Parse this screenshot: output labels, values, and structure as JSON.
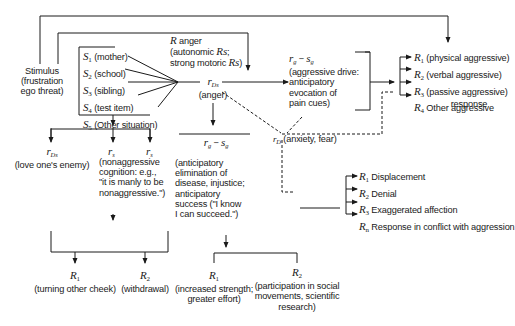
{
  "stimulus": {
    "line1": "Stimulus",
    "line2": "(frustration",
    "line3": "ego threat)"
  },
  "r_anger": {
    "symbol": "R",
    "label": "anger",
    "line2": "(autonomic ",
    "line2_sym": "Rs",
    "line2_end": ";",
    "line3": "strong motoric ",
    "line3_sym": "Rs",
    "line3_end": ")"
  },
  "stimuli_box": {
    "items": [
      {
        "sym": "S",
        "sub": "1",
        "label": "(mother)"
      },
      {
        "sym": "S",
        "sub": "2",
        "label": "(school)"
      },
      {
        "sym": "S",
        "sub": "3",
        "label": "(sibling)"
      },
      {
        "sym": "S",
        "sub": "4",
        "label": "(test item)"
      },
      {
        "sym": "S",
        "sub": "5",
        "label": "(Other situation)"
      }
    ]
  },
  "r_ds_anger": {
    "sym": "r",
    "sub": "Ds",
    "label": "(anger)"
  },
  "rg_sg_top": {
    "sym": "r",
    "sub1": "g",
    "minus": " − ",
    "sym2": "s",
    "sub2": "g",
    "line2": "(aggressive drive:",
    "line3": "anticipatory",
    "line4": "evocation of",
    "line5": "pain cues)"
  },
  "aggressive_responses": [
    {
      "sym": "R",
      "sub": "1",
      "label": "(physical aggressive)"
    },
    {
      "sym": "R",
      "sub": "2",
      "label": "(verbal aggressive)"
    },
    {
      "sym": "R",
      "sub": "3",
      "label": "(passive aggressive)"
    },
    {
      "sym": "R",
      "sub": "4",
      "label": "Other aggressive",
      "label2": "response"
    }
  ],
  "r_d_anxiety": {
    "sym": "r",
    "sub": "D",
    "label": "(anxiety, fear)"
  },
  "conflict_responses": [
    {
      "sym": "R",
      "sub": "1",
      "label": "Displacement"
    },
    {
      "sym": "R",
      "sub": "2",
      "label": "Denial"
    },
    {
      "sym": "R",
      "sub": "3",
      "label": "Exaggerated affection"
    },
    {
      "sym": "R",
      "sub": "n",
      "label": "Response in conflict with aggression"
    }
  ],
  "left_branch": {
    "r_ds": {
      "sym": "r",
      "sub": "Ds",
      "label": "(love one's enemy)"
    },
    "r_s1": {
      "sym": "r",
      "sub": "s"
    },
    "r_s2": {
      "sym": "r",
      "sub": "s"
    },
    "nonaggressive": {
      "line1": "(nonaggressive",
      "line2": "cognition: e.g.,",
      "line3": "\"it is manly to be",
      "line4": "nonaggressive.\")"
    },
    "R1": {
      "sym": "R",
      "sub": "1",
      "label": "(turning other cheek)"
    },
    "R2": {
      "sym": "R",
      "sub": "2",
      "label": "(withdrawal)"
    }
  },
  "middle_branch": {
    "rg_sg": {
      "sym": "r",
      "sub1": "g",
      "minus": " − ",
      "sym2": "s",
      "sub2": "g"
    },
    "desc": {
      "line1": "(anticipatory",
      "line2": "elimination of",
      "line3": "disease, injustice;",
      "line4": "anticipatory",
      "line5": "success (\"I know",
      "line6": "I can succeed.\")"
    },
    "R1": {
      "sym": "R",
      "sub": "1",
      "line1": "(increased strength;",
      "line2": "greater effort)"
    },
    "R2": {
      "sym": "R",
      "sub": "2",
      "line1": "(participation in social",
      "line2": "movements, scientific",
      "line3": "research)"
    }
  },
  "colors": {
    "line": "#1a1a1a",
    "text": "#1a1a1a",
    "background": "#ffffff"
  }
}
